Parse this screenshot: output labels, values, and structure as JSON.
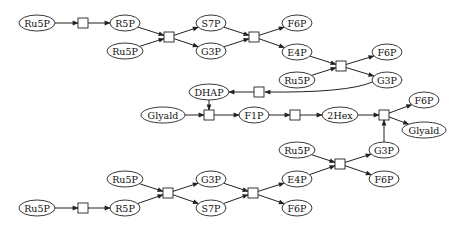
{
  "diagram": {
    "title": "",
    "type": "metabolic-reaction-network",
    "nodes": [
      {
        "id": "n1",
        "label": "Ru5P",
        "x": 37,
        "y": 23,
        "rx": 18
      },
      {
        "id": "n2",
        "label": "R5P",
        "x": 125,
        "y": 23,
        "rx": 15
      },
      {
        "id": "n3",
        "label": "Ru5P",
        "x": 125,
        "y": 51,
        "rx": 18
      },
      {
        "id": "n4",
        "label": "S7P",
        "x": 211,
        "y": 23,
        "rx": 15
      },
      {
        "id": "n5",
        "label": "G3P",
        "x": 211,
        "y": 51,
        "rx": 15
      },
      {
        "id": "n6",
        "label": "F6P",
        "x": 297,
        "y": 23,
        "rx": 15
      },
      {
        "id": "n7",
        "label": "E4P",
        "x": 297,
        "y": 52,
        "rx": 15
      },
      {
        "id": "n8",
        "label": "F6P",
        "x": 387,
        "y": 52,
        "rx": 15
      },
      {
        "id": "n9",
        "label": "Ru5P",
        "x": 297,
        "y": 80,
        "rx": 18
      },
      {
        "id": "n10",
        "label": "G3P",
        "x": 387,
        "y": 80,
        "rx": 15
      },
      {
        "id": "n11",
        "label": "DHAP",
        "x": 209,
        "y": 92,
        "rx": 20
      },
      {
        "id": "n12",
        "label": "Glyald",
        "x": 163,
        "y": 115,
        "rx": 22
      },
      {
        "id": "n13",
        "label": "F1P",
        "x": 254,
        "y": 115,
        "rx": 15
      },
      {
        "id": "n14",
        "label": "2Hex",
        "x": 340,
        "y": 115,
        "rx": 18
      },
      {
        "id": "n15",
        "label": "F6P",
        "x": 424,
        "y": 100,
        "rx": 15
      },
      {
        "id": "n16",
        "label": "Glyald",
        "x": 424,
        "y": 130,
        "rx": 22
      },
      {
        "id": "n17",
        "label": "Ru5P",
        "x": 297,
        "y": 150,
        "rx": 18
      },
      {
        "id": "n18",
        "label": "G3P",
        "x": 384,
        "y": 150,
        "rx": 15
      },
      {
        "id": "n19",
        "label": "F6P",
        "x": 384,
        "y": 179,
        "rx": 15
      },
      {
        "id": "n20",
        "label": "Ru5P",
        "x": 125,
        "y": 179,
        "rx": 18
      },
      {
        "id": "n21",
        "label": "G3P",
        "x": 211,
        "y": 179,
        "rx": 15
      },
      {
        "id": "n22",
        "label": "S7P",
        "x": 211,
        "y": 208,
        "rx": 15
      },
      {
        "id": "n23",
        "label": "E4P",
        "x": 297,
        "y": 179,
        "rx": 15
      },
      {
        "id": "n24",
        "label": "F6P",
        "x": 297,
        "y": 208,
        "rx": 15
      },
      {
        "id": "n25",
        "label": "Ru5P",
        "x": 37,
        "y": 208,
        "rx": 18
      },
      {
        "id": "n26",
        "label": "R5P",
        "x": 125,
        "y": 208,
        "rx": 15
      }
    ],
    "reactions": [
      {
        "id": "r1",
        "x": 83,
        "y": 23
      },
      {
        "id": "r2",
        "x": 169,
        "y": 37
      },
      {
        "id": "r3",
        "x": 254,
        "y": 37
      },
      {
        "id": "r4",
        "x": 341,
        "y": 66
      },
      {
        "id": "r5",
        "x": 259,
        "y": 92
      },
      {
        "id": "r6",
        "x": 209,
        "y": 115
      },
      {
        "id": "r7",
        "x": 295,
        "y": 115
      },
      {
        "id": "r8",
        "x": 384,
        "y": 115
      },
      {
        "id": "r9",
        "x": 340,
        "y": 164
      },
      {
        "id": "r10",
        "x": 168,
        "y": 193
      },
      {
        "id": "r11",
        "x": 253,
        "y": 193
      },
      {
        "id": "r12",
        "x": 83,
        "y": 208
      }
    ],
    "edges": [
      {
        "from": "n1",
        "to": "r1"
      },
      {
        "from": "r1",
        "to": "n2"
      },
      {
        "from": "n2",
        "to": "r2"
      },
      {
        "from": "n3",
        "to": "r2"
      },
      {
        "from": "r2",
        "to": "n4"
      },
      {
        "from": "r2",
        "to": "n5"
      },
      {
        "from": "n4",
        "to": "r3"
      },
      {
        "from": "n5",
        "to": "r3"
      },
      {
        "from": "r3",
        "to": "n6"
      },
      {
        "from": "r3",
        "to": "n7"
      },
      {
        "from": "n7",
        "to": "r4"
      },
      {
        "from": "n9",
        "to": "r4"
      },
      {
        "from": "r4",
        "to": "n8"
      },
      {
        "from": "r4",
        "to": "n10"
      },
      {
        "from": "n10",
        "to": "r5",
        "curve": true
      },
      {
        "from": "r5",
        "to": "n11"
      },
      {
        "from": "n11",
        "to": "r6"
      },
      {
        "from": "n12",
        "to": "r6"
      },
      {
        "from": "r6",
        "to": "n13"
      },
      {
        "from": "n13",
        "to": "r7"
      },
      {
        "from": "r7",
        "to": "n14"
      },
      {
        "from": "n14",
        "to": "r8"
      },
      {
        "from": "n18",
        "to": "r8"
      },
      {
        "from": "r8",
        "to": "n15"
      },
      {
        "from": "r8",
        "to": "n16"
      },
      {
        "from": "n17",
        "to": "r9"
      },
      {
        "from": "n23",
        "to": "r9"
      },
      {
        "from": "r9",
        "to": "n18"
      },
      {
        "from": "r9",
        "to": "n19"
      },
      {
        "from": "n20",
        "to": "r10"
      },
      {
        "from": "n26",
        "to": "r10"
      },
      {
        "from": "r10",
        "to": "n21"
      },
      {
        "from": "r10",
        "to": "n22"
      },
      {
        "from": "n21",
        "to": "r11"
      },
      {
        "from": "n22",
        "to": "r11"
      },
      {
        "from": "r11",
        "to": "n23"
      },
      {
        "from": "r11",
        "to": "n24"
      },
      {
        "from": "n25",
        "to": "r12"
      },
      {
        "from": "r12",
        "to": "n26"
      }
    ]
  }
}
